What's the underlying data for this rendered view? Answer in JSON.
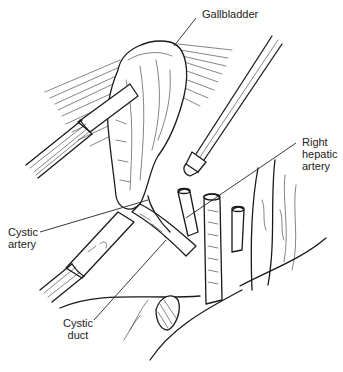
{
  "figure": {
    "type": "surgical-illustration",
    "labels": [
      {
        "id": "gallbladder",
        "text": "Gallbladder"
      },
      {
        "id": "right-hepatic-artery",
        "text": "Right\nhepatic\nartery"
      },
      {
        "id": "cystic-artery",
        "text": "Cystic\nartery"
      },
      {
        "id": "cystic-duct",
        "text": "Cystic\nduct"
      }
    ]
  }
}
